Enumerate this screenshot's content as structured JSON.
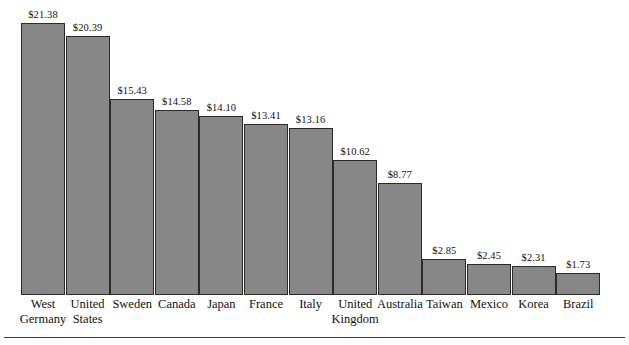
{
  "chart_data": {
    "type": "bar",
    "title": "",
    "subtitle": "",
    "xlabel": "",
    "ylabel": "",
    "grid": false,
    "legend": false,
    "legend_position": "none",
    "axis_visible": false,
    "value_label_format": "$0.00",
    "ylim": [
      0,
      21.38
    ],
    "categories": [
      "West Germany",
      "United States",
      "Sweden",
      "Canada",
      "Japan",
      "France",
      "Italy",
      "United Kingdom",
      "Australia",
      "Taiwan",
      "Mexico",
      "Korea",
      "Brazil"
    ],
    "category_lines": [
      [
        "West",
        "Germany"
      ],
      [
        "United",
        "States"
      ],
      [
        "Sweden"
      ],
      [
        "Canada"
      ],
      [
        "Japan"
      ],
      [
        "France"
      ],
      [
        "Italy"
      ],
      [
        "United",
        "Kingdom"
      ],
      [
        "Australia"
      ],
      [
        "Taiwan"
      ],
      [
        "Mexico"
      ],
      [
        "Korea"
      ],
      [
        "Brazil"
      ]
    ],
    "values": [
      21.38,
      20.39,
      15.43,
      14.58,
      14.1,
      13.41,
      13.16,
      10.62,
      8.77,
      2.85,
      2.45,
      2.31,
      1.73
    ],
    "value_labels": [
      "$21.38",
      "$20.39",
      "$15.43",
      "$14.58",
      "$14.10",
      "$13.41",
      "$13.16",
      "$10.62",
      "$8.77",
      "$2.85",
      "$2.45",
      "$2.31",
      "$1.73"
    ],
    "colors": {
      "bar_fill": "#878787",
      "bar_stroke": "#2b2b2b",
      "text": "#111111",
      "background": "#ffffff",
      "rule": "#3a3a3a"
    }
  },
  "layout": {
    "bar_left_px": 21,
    "bar_pitch_px": 44.6,
    "bar_width_px": 44,
    "baseline_y_px": 294,
    "px_per_unit": 12.72
  }
}
